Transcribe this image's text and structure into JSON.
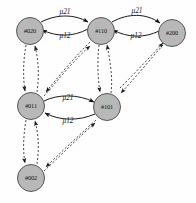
{
  "diagram": {
    "type": "state-transition-graph",
    "background": "#ffffff",
    "node_fill": "#b9b9b9",
    "node_stroke": "#4a4a4a",
    "nodes": [
      {
        "id": "n020",
        "label": "#020",
        "cx": 30,
        "cy": 31,
        "r": 13.5
      },
      {
        "id": "n110",
        "label": "#110",
        "cx": 101,
        "cy": 31,
        "r": 13.5
      },
      {
        "id": "n200",
        "label": "#200",
        "cx": 172,
        "cy": 33,
        "r": 13.5
      },
      {
        "id": "n011",
        "label": "#011",
        "cx": 31,
        "cy": 106,
        "r": 13.5
      },
      {
        "id": "n101",
        "label": "#101",
        "cx": 107,
        "cy": 107,
        "r": 13.5
      },
      {
        "id": "n002",
        "label": "#002",
        "cx": 31,
        "cy": 178,
        "r": 13.5
      }
    ],
    "solid_edges": [
      {
        "id": "e020-110",
        "from": "#020",
        "to": "#110",
        "label": "μ21",
        "label_x": 65,
        "label_y": 12,
        "style": "solid"
      },
      {
        "id": "e110-020",
        "from": "#110",
        "to": "#020",
        "label": "μ12",
        "label_x": 65,
        "label_y": 36,
        "style": "solid"
      },
      {
        "id": "e110-200",
        "from": "#110",
        "to": "#200",
        "label": "μ21",
        "label_x": 137,
        "label_y": 11,
        "style": "solid"
      },
      {
        "id": "e200-110",
        "from": "#200",
        "to": "#110",
        "label": "μ12",
        "label_x": 136,
        "label_y": 36,
        "style": "solid"
      },
      {
        "id": "e011-101",
        "from": "#011",
        "to": "#101",
        "label": "μ21",
        "label_x": 68,
        "label_y": 98,
        "style": "solid"
      },
      {
        "id": "e101-011",
        "from": "#101",
        "to": "#011",
        "label": "μ12",
        "label_x": 68,
        "label_y": 121,
        "style": "solid"
      }
    ],
    "dashed_edges": [
      {
        "id": "d020-011",
        "from": "#020",
        "to": "#011",
        "style": "dashed",
        "bidirectional": true
      },
      {
        "id": "d110-011",
        "from": "#110",
        "to": "#011",
        "style": "dashed",
        "bidirectional": true
      },
      {
        "id": "d110-101",
        "from": "#110",
        "to": "#101",
        "style": "dashed",
        "bidirectional": true
      },
      {
        "id": "d200-101",
        "from": "#200",
        "to": "#101",
        "style": "dashed",
        "bidirectional": true
      },
      {
        "id": "d011-002",
        "from": "#011",
        "to": "#002",
        "style": "dashed",
        "bidirectional": true
      },
      {
        "id": "d101-002",
        "from": "#101",
        "to": "#002",
        "style": "dashed",
        "bidirectional": true
      }
    ]
  }
}
